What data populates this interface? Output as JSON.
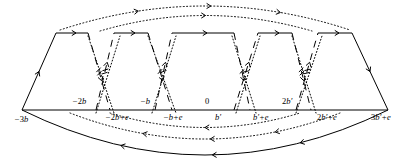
{
  "figure": {
    "name": "fundamental-domain-identification-diagram",
    "type": "diagram",
    "width": 410,
    "height": 164,
    "baseline_y": 110,
    "colors": {
      "ink": "#000000",
      "background": "#ffffff"
    }
  },
  "axis": {
    "name": "real-axis",
    "y": 110,
    "x_start": 22,
    "x_end": 388,
    "style": "solid"
  },
  "labels_above": [
    {
      "id": "lbl-minus-2b",
      "text": "−2b",
      "x": 72,
      "y": 104
    },
    {
      "id": "lbl-minus-b",
      "text": "−b",
      "x": 140,
      "y": 104
    },
    {
      "id": "lbl-zero",
      "text": "0",
      "x": 205,
      "y": 104
    },
    {
      "id": "lbl-2bprime",
      "text": "2b′",
      "x": 282,
      "y": 104
    }
  ],
  "labels_below": [
    {
      "id": "lbl-minus-3b",
      "text": "−3b",
      "x": 14,
      "y": 122
    },
    {
      "id": "lbl-minus-2b-plus-e",
      "text": "−2b+e",
      "x": 105,
      "y": 120
    },
    {
      "id": "lbl-minus-b-plus-e",
      "text": "−b+e",
      "x": 163,
      "y": 120
    },
    {
      "id": "lbl-bprime",
      "text": "b′",
      "x": 215,
      "y": 120
    },
    {
      "id": "lbl-bprime-plus-e",
      "text": "b′+e",
      "x": 253,
      "y": 120
    },
    {
      "id": "lbl-2bprime-plus-e",
      "text": "2b′+e",
      "x": 317,
      "y": 120
    },
    {
      "id": "lbl-3bprime-plus-e",
      "text": "3b′+e",
      "x": 371,
      "y": 120
    }
  ],
  "vertices": {
    "left_base": {
      "x": 22,
      "y": 110
    },
    "right_base": {
      "x": 388,
      "y": 110
    },
    "top_nodes": [
      {
        "id": "t1",
        "x": 56,
        "y": 33
      },
      {
        "id": "t2",
        "x": 88,
        "y": 33
      },
      {
        "id": "t3",
        "x": 114,
        "y": 33
      },
      {
        "id": "t4",
        "x": 148,
        "y": 33
      },
      {
        "id": "t5",
        "x": 172,
        "y": 33
      },
      {
        "id": "t6",
        "x": 234,
        "y": 33
      },
      {
        "id": "t7",
        "x": 258,
        "y": 33
      },
      {
        "id": "t8",
        "x": 292,
        "y": 33
      },
      {
        "id": "t9",
        "x": 318,
        "y": 33
      },
      {
        "id": "t10",
        "x": 352,
        "y": 33
      }
    ],
    "base_nodes": [
      {
        "id": "b1",
        "x": 96,
        "y": 110
      },
      {
        "id": "b2",
        "x": 110,
        "y": 110
      },
      {
        "id": "b3",
        "x": 155,
        "y": 110
      },
      {
        "id": "b4",
        "x": 172,
        "y": 110
      },
      {
        "id": "b5",
        "x": 234,
        "y": 110
      },
      {
        "id": "b6",
        "x": 250,
        "y": 110
      },
      {
        "id": "b7",
        "x": 296,
        "y": 110
      },
      {
        "id": "b8",
        "x": 311,
        "y": 110
      }
    ]
  },
  "edges": {
    "solid_top_segments": [
      {
        "id": "top-seg-1",
        "x1": 56,
        "x2": 88,
        "y": 33,
        "arrow": "right",
        "ticks": 0
      },
      {
        "id": "top-seg-2",
        "x1": 114,
        "x2": 148,
        "y": 33,
        "arrow": "right",
        "ticks": 0
      },
      {
        "id": "top-seg-3",
        "x1": 172,
        "x2": 234,
        "y": 33,
        "arrow": "right",
        "ticks": 0
      },
      {
        "id": "top-seg-4",
        "x1": 258,
        "x2": 292,
        "y": 33,
        "arrow": "right",
        "ticks": 0
      },
      {
        "id": "top-seg-5",
        "x1": 318,
        "x2": 352,
        "y": 33,
        "arrow": "right",
        "ticks": 0
      }
    ],
    "solid_slanted_sides": [
      {
        "id": "left-side",
        "x1": 22,
        "y1": 110,
        "x2": 56,
        "y2": 33,
        "arrow": "up"
      },
      {
        "id": "right-side",
        "x1": 352,
        "y1": 33,
        "x2": 388,
        "y2": 110,
        "arrow": "down"
      }
    ],
    "dashed_crossing_pairs": [
      {
        "id": "cross-1",
        "ticks": 2,
        "style": "dashed",
        "a": {
          "x1": 88,
          "y1": 33,
          "x2": 110,
          "y2": 110,
          "arrow": "down"
        },
        "b": {
          "x1": 96,
          "y1": 110,
          "x2": 114,
          "y2": 33,
          "arrow": "up"
        }
      },
      {
        "id": "cross-2",
        "ticks": 1,
        "style": "dashed",
        "a": {
          "x1": 148,
          "y1": 33,
          "x2": 172,
          "y2": 110,
          "arrow": "down"
        },
        "b": {
          "x1": 155,
          "y1": 110,
          "x2": 172,
          "y2": 33,
          "arrow": "up"
        }
      },
      {
        "id": "cross-3",
        "ticks": 1,
        "style": "dashed",
        "a": {
          "x1": 234,
          "y1": 33,
          "x2": 250,
          "y2": 110,
          "arrow": "down"
        },
        "b": {
          "x1": 234,
          "y1": 110,
          "x2": 258,
          "y2": 33,
          "arrow": "up"
        }
      },
      {
        "id": "cross-4",
        "ticks": 2,
        "style": "dashed",
        "a": {
          "x1": 292,
          "y1": 33,
          "x2": 311,
          "y2": 110,
          "arrow": "down"
        },
        "b": {
          "x1": 296,
          "y1": 110,
          "x2": 318,
          "y2": 33,
          "arrow": "up"
        }
      }
    ],
    "dotted_crossing_pairs": [
      {
        "id": "dot-cross-1",
        "a": {
          "x1": 88,
          "y1": 36,
          "x2": 114,
          "y2": 113
        },
        "b": {
          "x1": 96,
          "y1": 113,
          "x2": 120,
          "y2": 36
        }
      },
      {
        "id": "dot-cross-2",
        "a": {
          "x1": 148,
          "y1": 36,
          "x2": 176,
          "y2": 113
        },
        "b": {
          "x1": 152,
          "y1": 113,
          "x2": 176,
          "y2": 36
        }
      },
      {
        "id": "dot-cross-3",
        "a": {
          "x1": 232,
          "y1": 36,
          "x2": 256,
          "y2": 113
        },
        "b": {
          "x1": 236,
          "y1": 113,
          "x2": 260,
          "y2": 36
        }
      },
      {
        "id": "dot-cross-4",
        "a": {
          "x1": 292,
          "y1": 36,
          "x2": 316,
          "y2": 113
        },
        "b": {
          "x1": 296,
          "y1": 113,
          "x2": 322,
          "y2": 36
        }
      }
    ],
    "top_arcs": [
      {
        "id": "top-arc-outer",
        "style": "dotted",
        "direction": "right",
        "x1": 60,
        "y1": 30,
        "cx": 205,
        "cy": -18,
        "x2": 350,
        "y2": 30,
        "arrows": [
          0.27,
          0.52,
          0.76
        ]
      },
      {
        "id": "top-arc-inner",
        "style": "dotted",
        "direction": "right",
        "x1": 100,
        "y1": 31,
        "cx": 205,
        "cy": 0,
        "x2": 312,
        "y2": 31,
        "arrows": [
          0.5
        ]
      }
    ],
    "bottom_arcs": [
      {
        "id": "bottom-arc-inner-1",
        "style": "dotted",
        "direction": "left",
        "x1": 110,
        "y1": 113,
        "cx": 205,
        "cy": 142,
        "x2": 300,
        "y2": 113,
        "arrows": [
          0.5
        ]
      },
      {
        "id": "bottom-arc-inner-2",
        "style": "dotted",
        "direction": "left",
        "x1": 70,
        "y1": 113,
        "cx": 205,
        "cy": 165,
        "x2": 340,
        "y2": 113,
        "arrows": [
          0.27,
          0.52,
          0.76
        ]
      },
      {
        "id": "bottom-arc-outer",
        "style": "solid",
        "direction": "left",
        "x1": 22,
        "y1": 110,
        "cx": 205,
        "cy": 200,
        "x2": 388,
        "y2": 110,
        "arrows": [
          0.27,
          0.52,
          0.76
        ]
      }
    ]
  }
}
